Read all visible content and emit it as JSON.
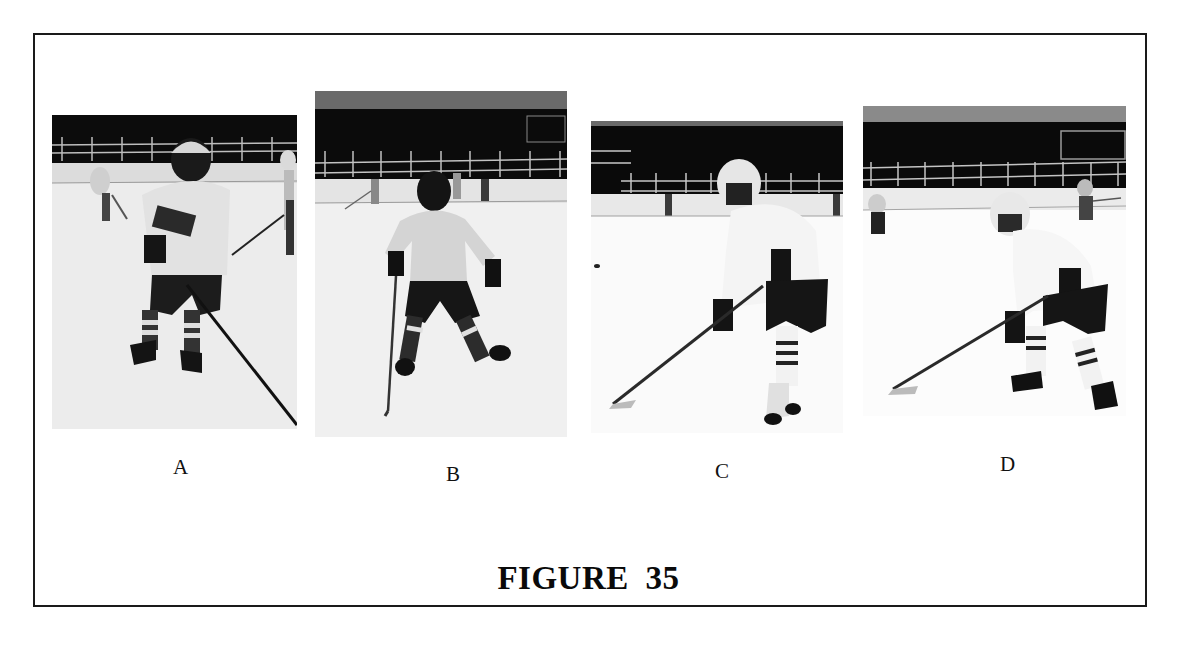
{
  "figure": {
    "title": "FIGURE 35",
    "panels": [
      {
        "id": "A",
        "label": "A",
        "description": "Youth hockey player in light jersey and dark helmet with cage, skating forward holding stick low, other skaters in background"
      },
      {
        "id": "B",
        "label": "B",
        "description": "Youth hockey player in light jersey and dark helmet, wide stance with stick held vertically in right hand"
      },
      {
        "id": "C",
        "label": "C",
        "description": "Youth hockey player in white jersey and white helmet, crouched stance with stick on ice angled to the left"
      },
      {
        "id": "D",
        "label": "D",
        "description": "Youth hockey player in white jersey and white helmet, crouched stance with stick extended to the left, skaters in background"
      }
    ]
  },
  "colors": {
    "border": "#1a1a1a",
    "background": "#ffffff",
    "text": "#111111"
  }
}
